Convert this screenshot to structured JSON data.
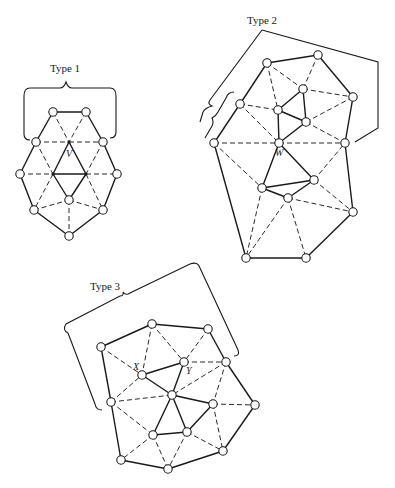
{
  "figure": {
    "width": 395,
    "height": 488,
    "colors": {
      "ink": "#1a1a1a",
      "background": "#ffffff"
    }
  },
  "diagrams": [
    {
      "id": "type1",
      "title": "Type 1",
      "title_pos": [
        65,
        72
      ],
      "bracket": "M24,96 Q24,88 30,88 L60,88 Q64,88 66,82 Q68,88 72,88 L110,88 Q116,88 116,96 L116,132 Q116,138 110,138",
      "bracket_extra": "M24,96 L24,134 Q24,140 30,140",
      "nodes": {
        "a": [
          53,
          112
        ],
        "b": [
          86,
          112
        ],
        "c": [
          36,
          142
        ],
        "V": [
          69,
          142
        ],
        "d": [
          103,
          142
        ],
        "e": [
          20,
          174
        ],
        "f": [
          53,
          174
        ],
        "g": [
          86,
          174
        ],
        "h": [
          117,
          174
        ],
        "i": [
          69,
          200
        ],
        "j": [
          34,
          210
        ],
        "k": [
          103,
          210
        ],
        "l": [
          69,
          236
        ]
      },
      "dots": [
        "V",
        "f",
        "g"
      ],
      "solid": [
        [
          "a",
          "b"
        ],
        [
          "a",
          "c"
        ],
        [
          "b",
          "d"
        ],
        [
          "c",
          "e"
        ],
        [
          "d",
          "h"
        ],
        [
          "e",
          "j"
        ],
        [
          "h",
          "k"
        ],
        [
          "j",
          "l"
        ],
        [
          "k",
          "l"
        ],
        [
          "V",
          "f"
        ],
        [
          "V",
          "g"
        ],
        [
          "f",
          "g"
        ],
        [
          "f",
          "i"
        ],
        [
          "g",
          "i"
        ]
      ],
      "dashed": [
        [
          "a",
          "V"
        ],
        [
          "b",
          "V"
        ],
        [
          "c",
          "V"
        ],
        [
          "V",
          "d"
        ],
        [
          "c",
          "f"
        ],
        [
          "d",
          "g"
        ],
        [
          "e",
          "f"
        ],
        [
          "g",
          "h"
        ],
        [
          "f",
          "j"
        ],
        [
          "g",
          "k"
        ],
        [
          "j",
          "i"
        ],
        [
          "i",
          "k"
        ],
        [
          "i",
          "l"
        ]
      ],
      "vertex_labels": [
        {
          "text": "V",
          "pos": [
            66,
            157
          ]
        }
      ]
    },
    {
      "id": "type2",
      "title": "Type 2",
      "title_pos": [
        262,
        24
      ],
      "bracket": "M262,30 L210,100 Q207,104 212,106 Q205,108 203,112 L200,122",
      "bracket_extra": "M262,30 L378,62 L378,128 L355,142",
      "bracket_inner": "M234,92 Q228,92 226,98 L218,112 Q216,116 212,118 Q214,122 212,126 L205,138",
      "nodes": {
        "A": [
          267,
          63
        ],
        "B": [
          318,
          55
        ],
        "D": [
          303,
          89
        ],
        "C": [
          353,
          97
        ],
        "E": [
          240,
          104
        ],
        "F": [
          278,
          110
        ],
        "G": [
          306,
          122
        ],
        "H": [
          214,
          143
        ],
        "W": [
          279,
          143
        ],
        "I": [
          345,
          143
        ],
        "K": [
          314,
          180
        ],
        "J": [
          262,
          188
        ],
        "L": [
          288,
          198
        ],
        "M": [
          353,
          212
        ],
        "N": [
          246,
          258
        ],
        "O": [
          306,
          258
        ]
      },
      "dots": [],
      "solid": [
        [
          "A",
          "B"
        ],
        [
          "B",
          "C"
        ],
        [
          "A",
          "E"
        ],
        [
          "E",
          "H"
        ],
        [
          "C",
          "I"
        ],
        [
          "D",
          "F"
        ],
        [
          "D",
          "G"
        ],
        [
          "F",
          "G"
        ],
        [
          "F",
          "W"
        ],
        [
          "G",
          "W"
        ],
        [
          "H",
          "N"
        ],
        [
          "I",
          "M"
        ],
        [
          "W",
          "J"
        ],
        [
          "W",
          "K"
        ],
        [
          "J",
          "K"
        ],
        [
          "J",
          "L"
        ],
        [
          "L",
          "K"
        ],
        [
          "M",
          "O"
        ],
        [
          "N",
          "O"
        ]
      ],
      "dashed": [
        [
          "A",
          "F"
        ],
        [
          "A",
          "D"
        ],
        [
          "B",
          "D"
        ],
        [
          "D",
          "C"
        ],
        [
          "E",
          "F"
        ],
        [
          "E",
          "W"
        ],
        [
          "G",
          "C"
        ],
        [
          "G",
          "I"
        ],
        [
          "H",
          "W"
        ],
        [
          "W",
          "I"
        ],
        [
          "H",
          "J"
        ],
        [
          "K",
          "I"
        ],
        [
          "K",
          "M"
        ],
        [
          "L",
          "M"
        ],
        [
          "J",
          "N"
        ],
        [
          "L",
          "N"
        ],
        [
          "L",
          "O"
        ]
      ],
      "vertex_labels": [
        {
          "text": "W",
          "pos": [
            275,
            156
          ]
        }
      ]
    },
    {
      "id": "type3",
      "title": "Type 3",
      "title_pos": [
        105,
        290
      ],
      "bracket": "M68,333 Q62,330 66,324 L120,296 Q124,296 123,292 Q126,296 130,293 L190,264 Q198,261 200,268 L238,350 Q240,356 234,356",
      "bracket_extra": "M68,333 L95,404 Q96,410 102,410",
      "nodes": {
        "P2": [
          152,
          324
        ],
        "P3": [
          208,
          329
        ],
        "P1": [
          101,
          347
        ],
        "Y": [
          184,
          362
        ],
        "P4": [
          226,
          362
        ],
        "X": [
          142,
          375
        ],
        "C": [
          172,
          395
        ],
        "P5": [
          111,
          402
        ],
        "P6": [
          213,
          404
        ],
        "P7": [
          255,
          405
        ],
        "P9": [
          187,
          432
        ],
        "P8": [
          153,
          435
        ],
        "P12": [
          223,
          451
        ],
        "P10": [
          121,
          460
        ],
        "P11": [
          168,
          469
        ]
      },
      "dots": [],
      "solid": [
        [
          "P1",
          "P2"
        ],
        [
          "P2",
          "P3"
        ],
        [
          "P3",
          "P4"
        ],
        [
          "P1",
          "P5"
        ],
        [
          "P5",
          "P10"
        ],
        [
          "P10",
          "P11"
        ],
        [
          "P11",
          "P12"
        ],
        [
          "P12",
          "P7"
        ],
        [
          "P7",
          "P4"
        ],
        [
          "X",
          "Y"
        ],
        [
          "X",
          "C"
        ],
        [
          "Y",
          "C"
        ],
        [
          "C",
          "P6"
        ],
        [
          "C",
          "P8"
        ],
        [
          "C",
          "P9"
        ],
        [
          "P8",
          "P9"
        ],
        [
          "P9",
          "P6"
        ]
      ],
      "dashed": [
        [
          "P1",
          "X"
        ],
        [
          "P2",
          "X"
        ],
        [
          "P2",
          "Y"
        ],
        [
          "P3",
          "Y"
        ],
        [
          "Y",
          "P4"
        ],
        [
          "P4",
          "C"
        ],
        [
          "P4",
          "P6"
        ],
        [
          "P6",
          "P7"
        ],
        [
          "P6",
          "P12"
        ],
        [
          "P9",
          "P12"
        ],
        [
          "P9",
          "P11"
        ],
        [
          "P8",
          "P11"
        ],
        [
          "P8",
          "P10"
        ],
        [
          "P5",
          "X"
        ],
        [
          "P5",
          "C"
        ],
        [
          "P5",
          "P8"
        ]
      ],
      "vertex_labels": [
        {
          "text": "X",
          "pos": [
            133,
            370
          ]
        },
        {
          "text": "Y",
          "pos": [
            186,
            374
          ]
        }
      ]
    }
  ]
}
